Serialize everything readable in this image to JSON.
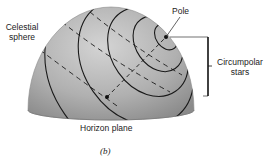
{
  "figure": {
    "caption": "(b)",
    "labels": {
      "celestial_sphere_line1": "Celestial",
      "celestial_sphere_line2": "sphere",
      "pole": "Pole",
      "circumpolar_line1": "Circumpolar",
      "circumpolar_line2": "stars",
      "horizon_plane": "Horizon plane"
    },
    "colors": {
      "sphere_light": "#d2d2d2",
      "sphere_dark": "#8a8a8a",
      "line": "#1a1a1a"
    }
  }
}
